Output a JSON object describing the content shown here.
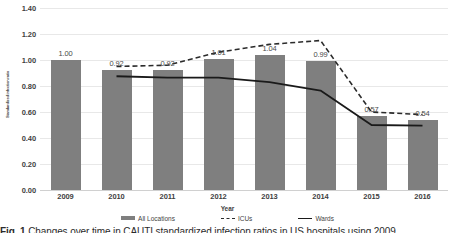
{
  "chart_data": {
    "type": "bar",
    "title": "",
    "xlabel": "Year",
    "ylabel": "Standardized infection ratio",
    "categories": [
      "2009",
      "2010",
      "2011",
      "2012",
      "2013",
      "2014",
      "2015",
      "2016"
    ],
    "ylim": [
      0.0,
      1.4
    ],
    "yticks": [
      "0.00",
      "0.20",
      "0.40",
      "0.60",
      "0.80",
      "1.00",
      "1.20",
      "1.40"
    ],
    "ytick_values": [
      0.0,
      0.2,
      0.4,
      0.6,
      0.8,
      1.0,
      1.2,
      1.4
    ],
    "grid": true,
    "legend_position": "bottom",
    "series": [
      {
        "name": "All Locations",
        "render": "bar",
        "color": "#7f7f7f",
        "values": [
          1.0,
          0.92,
          0.92,
          1.01,
          1.04,
          0.99,
          0.57,
          0.54
        ],
        "labels": [
          "1.00",
          "0.92",
          "0.92",
          "1.01",
          "1.04",
          "0.99",
          "0.57",
          "0.54"
        ]
      },
      {
        "name": "ICUs",
        "render": "dashed-line",
        "color": "#2b2b2b",
        "values": [
          null,
          0.95,
          0.96,
          1.06,
          1.12,
          1.15,
          0.6,
          0.58
        ]
      },
      {
        "name": "Wards",
        "render": "solid-line",
        "color": "#1a1a1a",
        "values": [
          null,
          0.875,
          0.865,
          0.865,
          0.83,
          0.765,
          0.5,
          0.495
        ]
      }
    ]
  },
  "legend": {
    "items": [
      {
        "label": "All Locations",
        "marker": "bar-swatch"
      },
      {
        "label": "ICUs",
        "marker": "dash-swatch"
      },
      {
        "label": "Wards",
        "marker": "solid-swatch"
      }
    ]
  },
  "caption": {
    "prefix": "Fig. 1",
    "text": "Changes over time in CAUTI standardized infection ratios in US hospitals using 2009"
  },
  "colors": {
    "bar": "#7f7f7f",
    "icu_line": "#2b2b2b",
    "wards_line": "#1a1a1a",
    "gridline": "#e8e8e8",
    "text": "#3f3f3f"
  }
}
